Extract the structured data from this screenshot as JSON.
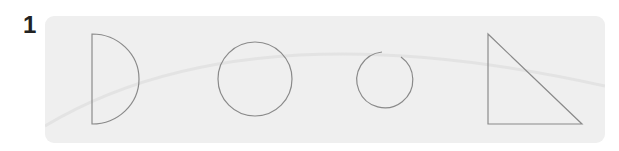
{
  "question": {
    "number": "1"
  },
  "panel": {
    "background": "#efefef",
    "stroke_color": "#8a8a8a",
    "shapes": [
      {
        "type": "half-circle",
        "label": "semicircle"
      },
      {
        "type": "circle",
        "label": "closed circle"
      },
      {
        "type": "open-circle",
        "label": "circle with gap"
      },
      {
        "type": "right-triangle",
        "label": "right triangle"
      }
    ]
  }
}
